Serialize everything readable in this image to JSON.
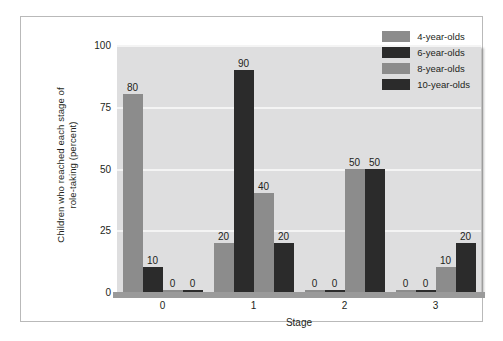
{
  "chart_data": {
    "type": "bar",
    "title": "",
    "subtitle": "",
    "xlabel": "Stage",
    "ylabel": "Children who reached each stage of role-taking (percent)",
    "ylabel_line1": "Children who reached each stage of",
    "ylabel_line2": "role-taking (percent)",
    "categories": [
      "0",
      "1",
      "2",
      "3"
    ],
    "ylim": [
      0,
      100
    ],
    "yticks": [
      100,
      75,
      50,
      25,
      0
    ],
    "grid": true,
    "grid_axis": "y",
    "legend_position": "top-right",
    "value_labels": true,
    "series": [
      {
        "name": "4-year-olds",
        "color": "#8c8c8c",
        "values": [
          80,
          20,
          0,
          0
        ]
      },
      {
        "name": "6-year-olds",
        "color": "#2b2b2b",
        "values": [
          10,
          90,
          0,
          0
        ]
      },
      {
        "name": "8-year-olds",
        "color": "#8c8c8c",
        "values": [
          0,
          40,
          50,
          10
        ]
      },
      {
        "name": "10-year-olds",
        "color": "#2b2b2b",
        "values": [
          0,
          20,
          50,
          20
        ]
      }
    ]
  },
  "style": {
    "panel_background": "#dededf",
    "gridline_color": "#f4f4f4",
    "axis_color": "#9a9a9a",
    "frame_color": "#b9b9b9",
    "text_color": "#231f20",
    "page_background": "#ffffff"
  }
}
